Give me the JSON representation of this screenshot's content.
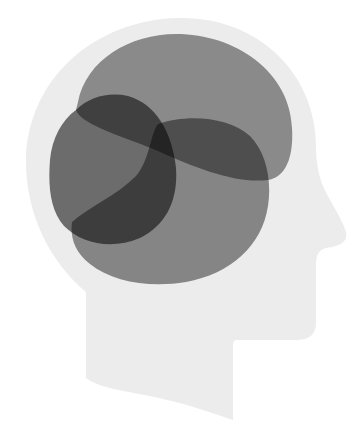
{
  "illustration": {
    "title": "Head profile with overlapping brain regions",
    "canvas": {
      "width": 363,
      "height": 444,
      "background": "#ffffff"
    },
    "head": {
      "name": "head-silhouette",
      "fill": "#ececec",
      "facing": "right"
    },
    "regions": [
      {
        "name": "top-region",
        "fill": "#8f8f8f",
        "opacity": 0.95
      },
      {
        "name": "left-region",
        "fill": "#6e6e6e",
        "opacity": 0.95
      },
      {
        "name": "bottom-right-region",
        "fill": "#8a8a8a",
        "opacity": 0.95
      }
    ]
  }
}
